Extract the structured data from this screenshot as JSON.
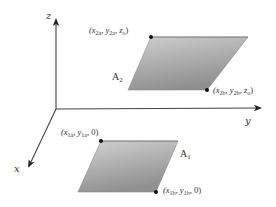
{
  "diagram": {
    "type": "3d-coordinate-system-with-parallel-planes",
    "axes": {
      "z": {
        "label": "z"
      },
      "y": {
        "label": "y"
      },
      "x": {
        "label": "x"
      }
    },
    "planes": [
      {
        "name": "A2",
        "label": "A",
        "label_sub": "2",
        "points": [
          {
            "id": "p2a",
            "text": "(x",
            "sub1": "2a",
            "mid1": ", y",
            "sub2": "2a",
            "mid2": ", z",
            "sub3": "o",
            "end": ")"
          },
          {
            "id": "p2b",
            "text": "(x",
            "sub1": "2b",
            "mid1": ", y",
            "sub2": "2b",
            "mid2": ", z",
            "sub3": "o",
            "end": ")"
          }
        ]
      },
      {
        "name": "A1",
        "label": "A",
        "label_sub": "1",
        "points": [
          {
            "id": "p1a",
            "text": "(x",
            "sub1": "1a",
            "mid1": ", y",
            "sub2": "1a",
            "end": ", 0)"
          },
          {
            "id": "p1b",
            "text": "(x",
            "sub1": "1b",
            "mid1": ", y",
            "sub2": "1b",
            "end": ", 0)"
          }
        ]
      }
    ],
    "colors": {
      "axis": "#333333",
      "plane_light": "#d4d4d4",
      "plane_dark": "#8e8e8e",
      "plane_edge": "#7a7a7a",
      "dot": "#111111"
    }
  }
}
